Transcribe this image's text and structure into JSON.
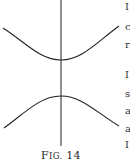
{
  "figure": {
    "caption_prefix": "F",
    "caption_smallcaps": "IG.",
    "caption_number": " 14",
    "stroke_color": "#222222",
    "axis": {
      "x": 61,
      "y_top": 0,
      "y_bottom": 146
    },
    "upper_branch": {
      "left": [
        3,
        28
      ],
      "vertex": [
        61,
        60
      ],
      "right": [
        119,
        26
      ]
    },
    "lower_branch": {
      "left": [
        4,
        128
      ],
      "vertex": [
        61,
        96
      ],
      "right": [
        119,
        126
      ]
    }
  },
  "margin_fragments": [
    "I",
    "c",
    "r",
    "I",
    "s",
    "a",
    "a",
    "I"
  ]
}
